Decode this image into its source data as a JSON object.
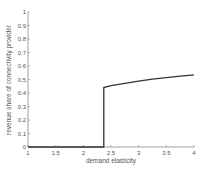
{
  "chart_data": {
    "type": "line",
    "title": "",
    "xlabel": "demand elasticity",
    "ylabel": "revenue share of connectivity provider",
    "xlim": [
      1,
      4
    ],
    "ylim": [
      0,
      1
    ],
    "xticks": [
      "1",
      "1.5",
      "2",
      "2.5",
      "3",
      "3.5",
      "4"
    ],
    "yticks": [
      "0",
      "0.1",
      "0.2",
      "0.3",
      "0.4",
      "0.5",
      "0.6",
      "0.7",
      "0.8",
      "0.9",
      "1"
    ],
    "grid": false,
    "legend": null,
    "series": [
      {
        "name": "revenue share",
        "color": "#333333",
        "x": [
          1.0,
          1.5,
          2.0,
          2.37,
          2.37,
          2.5,
          2.75,
          3.0,
          3.25,
          3.5,
          3.75,
          4.0
        ],
        "y": [
          0.0,
          0.0,
          0.0,
          0.0,
          0.44,
          0.455,
          0.472,
          0.488,
          0.502,
          0.514,
          0.525,
          0.535
        ]
      }
    ]
  }
}
